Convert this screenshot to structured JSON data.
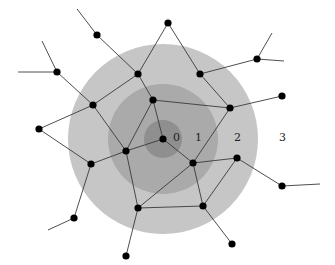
{
  "diagram": {
    "type": "network-hop-distance",
    "center_node": "c",
    "rings": [
      {
        "level": 0,
        "label": "0",
        "color": "#8f8f8f"
      },
      {
        "level": 1,
        "label": "1",
        "color": "#aaaaaa"
      },
      {
        "level": 2,
        "label": "2",
        "color": "#c6c6c6"
      },
      {
        "level": 3,
        "label": "3",
        "color": "#ffffff"
      }
    ],
    "ring_labels": [
      "0",
      "1",
      "2",
      "3"
    ],
    "nodes": [
      {
        "id": "c"
      },
      {
        "id": "n1"
      },
      {
        "id": "n2"
      },
      {
        "id": "n3"
      },
      {
        "id": "n4"
      },
      {
        "id": "n5"
      },
      {
        "id": "n6"
      },
      {
        "id": "n7"
      },
      {
        "id": "n8"
      },
      {
        "id": "n9"
      },
      {
        "id": "n10"
      },
      {
        "id": "n11"
      },
      {
        "id": "n12"
      },
      {
        "id": "n13"
      },
      {
        "id": "n14"
      },
      {
        "id": "n15"
      },
      {
        "id": "n16"
      },
      {
        "id": "n17"
      },
      {
        "id": "n18"
      },
      {
        "id": "n19"
      },
      {
        "id": "n20"
      }
    ],
    "edges": [
      [
        "c",
        "n3"
      ],
      [
        "c",
        "n6"
      ],
      [
        "c",
        "n7"
      ],
      [
        "n3",
        "n1"
      ],
      [
        "n3",
        "n4"
      ],
      [
        "n3",
        "n6"
      ],
      [
        "n1",
        "n5"
      ],
      [
        "n1",
        "n14"
      ],
      [
        "n2",
        "n3"
      ],
      [
        "n2",
        "n4"
      ],
      [
        "n2",
        "n12"
      ],
      [
        "n2",
        "n13"
      ],
      [
        "n4",
        "n7"
      ],
      [
        "n4",
        "n12"
      ],
      [
        "n5",
        "n6"
      ],
      [
        "n5",
        "n15"
      ],
      [
        "n5",
        "n16"
      ],
      [
        "n6",
        "n9"
      ],
      [
        "n6",
        "n10"
      ],
      [
        "n7",
        "n8"
      ],
      [
        "n7",
        "n10"
      ],
      [
        "n7",
        "n11"
      ],
      [
        "n8",
        "n11"
      ],
      [
        "n8",
        "n18"
      ],
      [
        "n9",
        "n16"
      ],
      [
        "n9",
        "n13b"
      ],
      [
        "n10",
        "n11"
      ],
      [
        "n10",
        "n20"
      ],
      [
        "n11",
        "n19"
      ],
      [
        "n12",
        "t1"
      ],
      [
        "n12",
        "t2"
      ],
      [
        "n15",
        "t3"
      ],
      [
        "n14",
        "t4"
      ],
      [
        "n18",
        "t5"
      ],
      [
        "n13b",
        "t6"
      ]
    ],
    "node_color": "#000000",
    "edge_color": "#3a3a3a"
  }
}
